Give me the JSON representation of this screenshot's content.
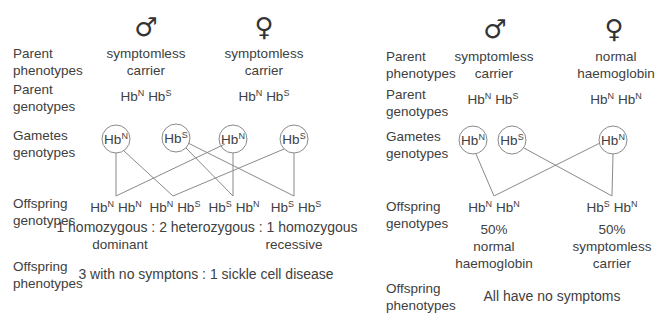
{
  "left_cross": {
    "male_symbol": "♂",
    "female_symbol": "♀",
    "row_labels": {
      "parent_phenotypes": [
        "Parent",
        "phenotypes"
      ],
      "parent_genotypes": [
        "Parent",
        "genotypes"
      ],
      "gametes": [
        "Gametes",
        "genotypes"
      ],
      "offspring_genotypes": [
        "Offspring",
        "genotypes"
      ],
      "offspring_phenotypes": [
        "Offspring",
        "phenotypes"
      ]
    },
    "male_phenotype": [
      "symptomless",
      "carrier"
    ],
    "female_phenotype": [
      "symptomless",
      "carrier"
    ],
    "male_genotype": {
      "a": "N",
      "b": "S"
    },
    "female_genotype": {
      "a": "N",
      "b": "S"
    },
    "gametes": [
      "N",
      "S",
      "N",
      "S"
    ],
    "offspring": [
      {
        "a": "N",
        "b": "N"
      },
      {
        "a": "N",
        "b": "S"
      },
      {
        "a": "S",
        "b": "N"
      },
      {
        "a": "S",
        "b": "S"
      }
    ],
    "ratio_line": "1 homozygous : 2 heterozygous : 1 homozygous",
    "ratio_sub_left": "dominant",
    "ratio_sub_right": "recessive",
    "phenotype_summary": "3 with no symptons : 1 sickle cell disease"
  },
  "right_cross": {
    "male_symbol": "♂",
    "female_symbol": "♀",
    "row_labels": {
      "parent_phenotypes": [
        "Parent",
        "phenotypes"
      ],
      "parent_genotypes": [
        "Parent",
        "genotypes"
      ],
      "gametes": [
        "Gametes",
        "genotypes"
      ],
      "offspring_genotypes": [
        "Offspring",
        "genotypes"
      ],
      "offspring_phenotypes": [
        "Offspring",
        "phenotypes"
      ]
    },
    "male_phenotype": [
      "symptomless",
      "carrier"
    ],
    "female_phenotype": [
      "normal",
      "haemoglobin"
    ],
    "male_genotype": {
      "a": "N",
      "b": "S"
    },
    "female_genotype": {
      "a": "N",
      "b": "N"
    },
    "gametes": [
      "N",
      "S",
      "N"
    ],
    "offspring": [
      {
        "a": "N",
        "b": "N",
        "pct": "50%",
        "desc": [
          "normal",
          "haemoglobin"
        ]
      },
      {
        "a": "S",
        "b": "N",
        "pct": "50%",
        "desc": [
          "symptomless",
          "carrier"
        ]
      }
    ],
    "phenotype_summary": "All have no symptoms"
  },
  "allele_prefix": "Hb"
}
